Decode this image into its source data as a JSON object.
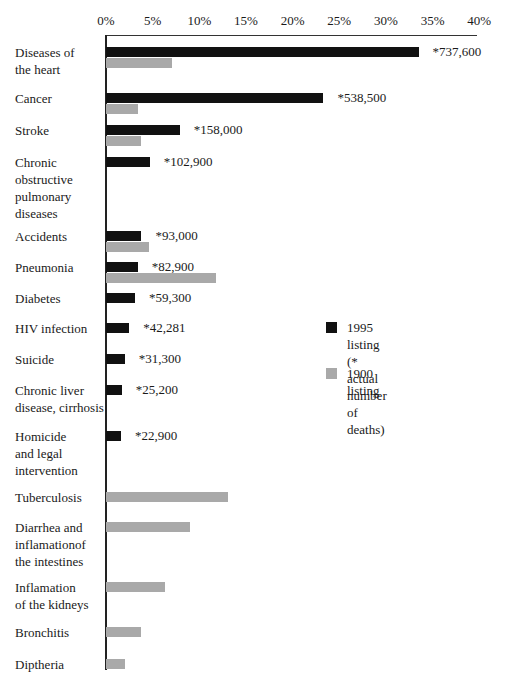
{
  "chart_data": {
    "type": "bar",
    "orientation": "horizontal",
    "title": "",
    "xlabel": "",
    "ylabel": "",
    "xlim": [
      0,
      40
    ],
    "x_ticks": [
      "0%",
      "5%",
      "10%",
      "15%",
      "20%",
      "25%",
      "30%",
      "35%",
      "40%"
    ],
    "grid": false,
    "legend_position": "right-middle",
    "categories": [
      "Diseases of the heart",
      "Cancer",
      "Stroke",
      "Chronic obstructive pulmonary diseases",
      "Accidents",
      "Pneumonia",
      "Diabetes",
      "HIV infection",
      "Suicide",
      "Chronic liver disease, cirrhosis",
      "Homicide and legal intervention",
      "Tuberculosis",
      "Diarrhea and inflamationof the intestines",
      "Inflamation of the kidneys",
      "Bronchitis",
      "Diptheria"
    ],
    "series": [
      {
        "name": "1995 listing",
        "color": "#111111",
        "values": [
          33.5,
          23.3,
          7.9,
          4.7,
          3.8,
          3.4,
          3.1,
          2.5,
          2.0,
          1.7,
          1.6,
          null,
          null,
          null,
          null,
          null
        ],
        "annotations": [
          "*737,600",
          "*538,500",
          "*158,000",
          "*102,900",
          "*93,000",
          "*82,900",
          "*59,300",
          "*42,281",
          "*31,300",
          "*25,200",
          "*22,900",
          null,
          null,
          null,
          null,
          null
        ]
      },
      {
        "name": "1900 listing",
        "color": "#a9a9a9",
        "values": [
          7.1,
          3.4,
          3.8,
          null,
          4.6,
          11.8,
          null,
          null,
          null,
          null,
          null,
          13.1,
          9.0,
          6.3,
          3.7,
          2.0
        ]
      }
    ],
    "legend": [
      {
        "label": "1995 listing",
        "sublabel": "(* actual number of deaths)",
        "color": "#111111"
      },
      {
        "label": "1900 listing",
        "color": "#a9a9a9"
      }
    ]
  },
  "labels": {
    "ticks": [
      "0%",
      "5%",
      "10%",
      "15%",
      "20%",
      "25%",
      "30%",
      "35%",
      "40%"
    ],
    "rows": [
      {
        "label": "Diseases of\nthe heart",
        "v1995": 33.5,
        "v1900": 7.1,
        "ann": "*737,600",
        "y": 47
      },
      {
        "label": "Cancer",
        "v1995": 23.3,
        "v1900": 3.4,
        "ann": "*538,500",
        "y": 93
      },
      {
        "label": "Stroke",
        "v1995": 7.9,
        "v1900": 3.8,
        "ann": "*158,000",
        "y": 125
      },
      {
        "label": "Chronic\nobstructive\npulmonary\ndiseases",
        "v1995": 4.7,
        "v1900": null,
        "ann": "*102,900",
        "y": 157
      },
      {
        "label": "Accidents",
        "v1995": 3.8,
        "v1900": 4.6,
        "ann": "*93,000",
        "y": 231
      },
      {
        "label": "Pneumonia",
        "v1995": 3.4,
        "v1900": 11.8,
        "ann": "*82,900",
        "y": 262
      },
      {
        "label": "Diabetes",
        "v1995": 3.1,
        "v1900": null,
        "ann": "*59,300",
        "y": 293
      },
      {
        "label": "HIV infection",
        "v1995": 2.5,
        "v1900": null,
        "ann": "*42,281",
        "y": 323
      },
      {
        "label": "Suicide",
        "v1995": 2.0,
        "v1900": null,
        "ann": "*31,300",
        "y": 354
      },
      {
        "label": "Chronic liver\ndisease, cirrhosis",
        "v1995": 1.7,
        "v1900": null,
        "ann": "*25,200",
        "y": 385
      },
      {
        "label": "Homicide\nand legal\nintervention",
        "v1995": 1.6,
        "v1900": null,
        "ann": "*22,900",
        "y": 431
      },
      {
        "label": "Tuberculosis",
        "v1995": null,
        "v1900": 13.1,
        "ann": null,
        "y": 492
      },
      {
        "label": "Diarrhea and\ninflamationof\nthe intestines",
        "v1995": null,
        "v1900": 9.0,
        "ann": null,
        "y": 522
      },
      {
        "label": "Inflamation\nof the kidneys",
        "v1995": null,
        "v1900": 6.3,
        "ann": null,
        "y": 582
      },
      {
        "label": "Bronchitis",
        "v1995": null,
        "v1900": 3.7,
        "ann": null,
        "y": 627
      },
      {
        "label": "Diptheria",
        "v1995": null,
        "v1900": 2.0,
        "ann": null,
        "y": 659
      }
    ],
    "legend_1995": "1995 listing\n(* actual number of deaths)",
    "legend_1900": "1900 listing"
  }
}
